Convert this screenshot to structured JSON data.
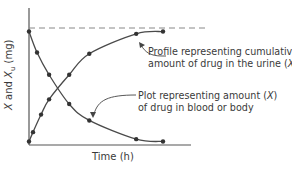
{
  "chart_data": {
    "type": "line",
    "title": "",
    "xlabel": "Time (h)",
    "ylabel": "X and X_u (mg)",
    "ylabel_parts": {
      "x1": "X",
      "and": " and ",
      "x2": "X",
      "sub": "u",
      "unit": " (mg)"
    },
    "grid": false,
    "ticks": "none",
    "asymptote": {
      "style": "dashed",
      "value": 1.0,
      "description": "total dose / plateau"
    },
    "series": [
      {
        "name": "Profile representing cumulative amount of drug in the urine (X_u)",
        "shape": "rising",
        "x": [
          0.0,
          0.03,
          0.09,
          0.15,
          0.3,
          0.45,
          0.8,
          1.0
        ],
        "y": [
          0.03,
          0.11,
          0.26,
          0.39,
          0.6,
          0.78,
          0.95,
          0.97
        ]
      },
      {
        "name": "Plot representing amount (X) of drug in blood or body",
        "shape": "decaying",
        "x": [
          0.0,
          0.06,
          0.15,
          0.3,
          0.45,
          0.8,
          1.0
        ],
        "y": [
          0.97,
          0.79,
          0.6,
          0.35,
          0.21,
          0.05,
          0.03
        ]
      }
    ],
    "annotations": [
      {
        "text_line1": "Profile representing cumulative",
        "text_line2": "amount of drug in the urine (X",
        "sub": "u",
        "close": ")"
      },
      {
        "text_line1": "Plot representing amount (X)",
        "text_line2": "of drug in blood or body"
      }
    ]
  },
  "labels": {
    "xlabel": "Time (h)",
    "ann_urine_1": "Profile representing cumulative",
    "ann_urine_2": "amount of drug in the urine (",
    "ann_urine_var": "X",
    "ann_urine_sub": "u",
    "ann_urine_close": ")",
    "ann_body_1": "Plot representing amount (",
    "ann_body_var": "X",
    "ann_body_close": ")",
    "ann_body_2": "of drug in blood or body",
    "ylab_x": "X",
    "ylab_and": " and ",
    "ylab_x2": "X",
    "ylab_sub": "u",
    "ylab_unit": " (mg)"
  }
}
